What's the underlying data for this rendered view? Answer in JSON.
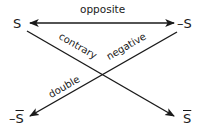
{
  "diagram": {
    "nodes": {
      "top_left": {
        "prefix": "",
        "symbol": "S",
        "overbar": false
      },
      "top_right": {
        "prefix": "–",
        "symbol": "S",
        "overbar": false
      },
      "bottom_left": {
        "prefix": "–",
        "symbol": "S",
        "overbar": true
      },
      "bottom_right": {
        "prefix": "",
        "symbol": "S",
        "overbar": true
      }
    },
    "edges": [
      {
        "id": "opposite",
        "label": "opposite",
        "from": "top_left",
        "to": "top_right",
        "arrows": "both"
      },
      {
        "id": "contrary",
        "label": "contrary",
        "from": "top_left",
        "to": "bottom_right",
        "arrows": "end"
      },
      {
        "id": "negative",
        "label": "negative",
        "from": "top_right",
        "to": "bottom_left",
        "arrows": "end"
      },
      {
        "id": "double",
        "label": "double",
        "from": "top_right",
        "to": "bottom_left",
        "arrows": "end"
      }
    ],
    "colors": {
      "line": "#1a1a1a",
      "text": "#1a1a1a",
      "background": "#ffffff"
    }
  }
}
